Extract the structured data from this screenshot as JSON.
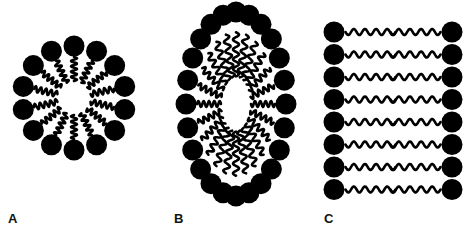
{
  "figure": {
    "width": 476,
    "height": 243,
    "background_color": "#ffffff",
    "ink_color": "#000000"
  },
  "panels": [
    {
      "id": "A",
      "label": "A",
      "name": "spherical-micelle",
      "description": "Spherical micelle: amphiphile molecules arranged radially with polar head groups facing outward and hydrophobic tails pointing into the hollow core.",
      "lipid_count": 14,
      "geometry": {
        "type": "radial-ring",
        "center_x": 74,
        "center_y": 98,
        "head_radius": 10.5,
        "head_orbit_radius": 52,
        "tail_inner_radius": 17,
        "tail_outer_radius": 41,
        "tail_waves": 4.5,
        "tail_amplitude": 3.0,
        "tail_stroke": 2.6,
        "start_angle_deg": -90
      }
    },
    {
      "id": "B",
      "label": "B",
      "name": "elongated-micelle",
      "description": "Elongated (rod-like / prolate) micelle: amphiphiles wrap an oval core, head groups outward, tails inward filling the elongated hydrophobic interior.",
      "lipid_count": 24,
      "geometry": {
        "type": "elliptical-ring",
        "center_x": 78,
        "center_y": 104,
        "head_radius": 10.5,
        "orbit_rx": 50,
        "orbit_ry": 92,
        "tail_inner_scale": 0.3,
        "tail_outer_scale": 0.78,
        "tail_waves": 4.5,
        "tail_amplitude": 3.0,
        "tail_stroke": 2.6,
        "start_angle_deg": -90
      }
    },
    {
      "id": "C",
      "label": "C",
      "name": "lipid-bilayer",
      "description": "Planar lipid bilayer: two opposed leaflets of amphiphiles with polar head groups on the outer faces and hydrophobic tails meeting in the middle.",
      "rows": 8,
      "leaflets": 2,
      "lipid_count": 16,
      "geometry": {
        "left_head_x": 16,
        "right_head_x": 134,
        "head_radius": 10.5,
        "first_row_y": 32,
        "row_spacing": 22.5,
        "tail_length": 50,
        "tail_gap": 1,
        "tail_waves": 4.5,
        "tail_amplitude": 3.0,
        "tail_stroke": 2.6
      }
    }
  ],
  "legend": {
    "head_group_name": "polar head group",
    "tail_name": "hydrophobic tail"
  }
}
